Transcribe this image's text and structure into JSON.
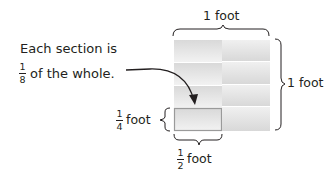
{
  "diagram": {
    "top_label": "1 foot",
    "right_label": "1 foot",
    "caption_line1": "Each section is",
    "caption_fraction": {
      "numerator": "1",
      "denominator": "8"
    },
    "caption_line2": "of the whole.",
    "height_label": {
      "numerator": "1",
      "denominator": "4",
      "unit": "foot"
    },
    "width_label": {
      "numerator": "1",
      "denominator": "2",
      "unit": "foot"
    },
    "grid": {
      "rows": 4,
      "columns": 2,
      "highlighted_cell": {
        "row": 4,
        "column": 1
      }
    },
    "colors": {
      "cell_fill": "#e6e6e6",
      "cell_border": "#ffffff",
      "highlight_border": "#9a9a9a",
      "text": "#231f20"
    }
  }
}
